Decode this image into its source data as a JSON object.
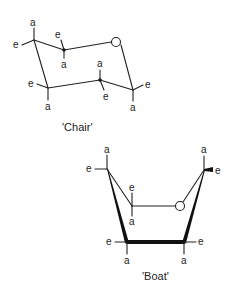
{
  "chair": {
    "caption": "'Chair'",
    "ring_atom": "O",
    "labels": {
      "c1_axial": "a",
      "c1_equatorial": "e",
      "c2_equatorial": "e",
      "c2_axial": "a",
      "c3_equatorial": "e",
      "c3_axial": "a",
      "c4_axial": "a",
      "c4_equatorial": "e",
      "c5_equatorial": "e",
      "c5_axial": "a"
    }
  },
  "boat": {
    "caption": "'Boat'",
    "ring_atom": "O",
    "labels": {
      "tl_axial": "a",
      "tl_equatorial": "e",
      "inner_equatorial": "e",
      "inner_axial": "a",
      "tr_axial": "a",
      "tr_equatorial": "e",
      "bl_equatorial": "e",
      "bl_axial": "a",
      "br_equatorial": "e",
      "br_axial": "a"
    }
  },
  "colors": {
    "ink": "#222222",
    "background": "#ffffff"
  }
}
